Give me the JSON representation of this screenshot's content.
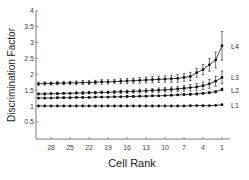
{
  "chart_data": {
    "type": "line",
    "title": "",
    "xlabel": "Cell Rank",
    "ylabel": "Discrimination Factor",
    "x_reversed": true,
    "xlim": [
      30,
      1
    ],
    "ylim": [
      0.3,
      4
    ],
    "xticks": [
      28,
      25,
      22,
      19,
      16,
      13,
      10,
      7,
      4,
      1
    ],
    "yticks": [
      0.5,
      1,
      1.5,
      2,
      2.5,
      3,
      3.5,
      4
    ],
    "ytick_labels": [
      "0.5",
      "1",
      "1.5",
      "2",
      "2.5",
      "3",
      "3.5",
      "4"
    ],
    "grid": false,
    "legend": "inline labels at right end of each series",
    "x": [
      30,
      29,
      28,
      27,
      26,
      25,
      24,
      23,
      22,
      21,
      20,
      19,
      18,
      17,
      16,
      15,
      14,
      13,
      12,
      11,
      10,
      9,
      8,
      7,
      6,
      5,
      4,
      3,
      2,
      1
    ],
    "series": [
      {
        "name": "L4",
        "values": [
          1.7,
          1.71,
          1.71,
          1.72,
          1.72,
          1.73,
          1.73,
          1.74,
          1.74,
          1.75,
          1.76,
          1.76,
          1.77,
          1.78,
          1.79,
          1.8,
          1.81,
          1.82,
          1.83,
          1.84,
          1.85,
          1.86,
          1.87,
          1.9,
          1.93,
          2.05,
          2.15,
          2.3,
          2.45,
          2.9
        ],
        "errors": [
          0.05,
          0.05,
          0.05,
          0.05,
          0.05,
          0.05,
          0.06,
          0.06,
          0.06,
          0.06,
          0.07,
          0.07,
          0.07,
          0.08,
          0.08,
          0.08,
          0.09,
          0.09,
          0.1,
          0.1,
          0.1,
          0.11,
          0.12,
          0.12,
          0.13,
          0.14,
          0.16,
          0.2,
          0.25,
          0.45
        ]
      },
      {
        "name": "L3",
        "values": [
          1.38,
          1.38,
          1.39,
          1.39,
          1.4,
          1.4,
          1.41,
          1.41,
          1.42,
          1.42,
          1.43,
          1.43,
          1.44,
          1.45,
          1.45,
          1.46,
          1.47,
          1.48,
          1.49,
          1.5,
          1.51,
          1.52,
          1.54,
          1.56,
          1.58,
          1.6,
          1.64,
          1.7,
          1.78,
          1.9
        ],
        "errors": [
          0.03,
          0.03,
          0.03,
          0.03,
          0.03,
          0.03,
          0.03,
          0.04,
          0.04,
          0.04,
          0.04,
          0.04,
          0.05,
          0.05,
          0.05,
          0.05,
          0.06,
          0.06,
          0.06,
          0.07,
          0.07,
          0.08,
          0.08,
          0.09,
          0.1,
          0.11,
          0.12,
          0.14,
          0.16,
          0.2
        ]
      },
      {
        "name": "L2",
        "values": [
          1.25,
          1.25,
          1.25,
          1.26,
          1.26,
          1.26,
          1.27,
          1.27,
          1.27,
          1.28,
          1.28,
          1.28,
          1.29,
          1.29,
          1.3,
          1.3,
          1.31,
          1.31,
          1.32,
          1.32,
          1.33,
          1.34,
          1.35,
          1.36,
          1.37,
          1.38,
          1.4,
          1.42,
          1.45,
          1.52
        ],
        "errors": [
          0.02,
          0.02,
          0.02,
          0.02,
          0.02,
          0.02,
          0.02,
          0.02,
          0.02,
          0.02,
          0.02,
          0.02,
          0.02,
          0.02,
          0.02,
          0.02,
          0.02,
          0.02,
          0.02,
          0.02,
          0.02,
          0.02,
          0.02,
          0.03,
          0.03,
          0.03,
          0.03,
          0.03,
          0.03,
          0.04
        ]
      },
      {
        "name": "L1",
        "values": [
          1.0,
          1.0,
          1.0,
          1.0,
          1.0,
          1.0,
          1.0,
          1.0,
          1.0,
          1.0,
          1.0,
          1.0,
          1.0,
          1.0,
          1.0,
          1.0,
          1.0,
          1.0,
          1.0,
          1.0,
          1.0,
          1.0,
          1.0,
          1.0,
          1.01,
          1.01,
          1.01,
          1.01,
          1.02,
          1.04
        ],
        "errors": [
          0,
          0,
          0,
          0,
          0,
          0,
          0,
          0,
          0,
          0,
          0,
          0,
          0,
          0,
          0,
          0,
          0,
          0,
          0,
          0,
          0,
          0,
          0,
          0,
          0,
          0,
          0,
          0,
          0,
          0
        ]
      }
    ]
  },
  "colors": {
    "line": "#111111",
    "axis": "#555555",
    "background": "#ffffff"
  }
}
